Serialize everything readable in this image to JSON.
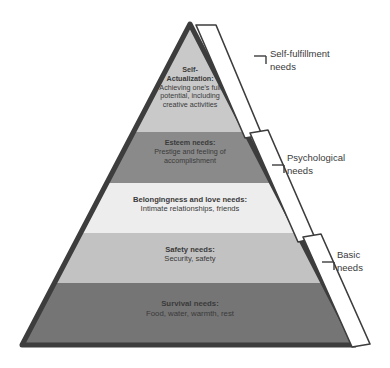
{
  "diagram": {
    "name": "maslow-hierarchy-of-needs",
    "colors": {
      "outline": "#3d3d3d",
      "text": "#3a3a3a",
      "bracket_stroke": "#3d3d3d",
      "bracket_fill": "#ffffff",
      "background": "#ffffff"
    },
    "tiers": [
      {
        "id": "self-actualization",
        "title": "Self-Actualization:",
        "title_lines": [
          "Self-",
          "Actualization:"
        ],
        "description": "Achieving one's full potential, including creative activities",
        "description_lines": [
          "Achieving one's full",
          "potential, including",
          "creative activities"
        ],
        "fill": "#c9c9c9"
      },
      {
        "id": "esteem",
        "title": "Esteem needs:",
        "title_lines": [
          "Esteem needs:"
        ],
        "description": "Prestige and feeling of accomplishment",
        "description_lines": [
          "Prestige and feeling of",
          "accomplishment"
        ],
        "fill": "#8a8a8a"
      },
      {
        "id": "belongingness-and-love",
        "title": "Belongingness and love needs:",
        "title_lines": [
          "Belongingness and love needs:"
        ],
        "description": "Intimate relationships, friends",
        "description_lines": [
          "Intimate relationships, friends"
        ],
        "fill": "#ededed"
      },
      {
        "id": "safety",
        "title": "Safety needs:",
        "title_lines": [
          "Safety needs:"
        ],
        "description": "Security, safety",
        "description_lines": [
          "Security, safety"
        ],
        "fill": "#c2c2c2"
      },
      {
        "id": "survival",
        "title": "Survival needs:",
        "title_lines": [
          "Survival needs:"
        ],
        "description": "Food, water, warmth, rest",
        "description_lines": [
          "Food, water, warmth, rest"
        ],
        "fill": "#757575"
      }
    ],
    "brackets": [
      {
        "id": "self-fulfillment",
        "label": "Self-fulfillment needs",
        "label_lines": [
          "Self-fulfillment",
          "needs"
        ]
      },
      {
        "id": "psychological",
        "label": "Psychological needs",
        "label_lines": [
          "Psychological",
          "needs"
        ]
      },
      {
        "id": "basic",
        "label": "Basic needs",
        "label_lines": [
          "Basic",
          "needs"
        ]
      }
    ]
  }
}
